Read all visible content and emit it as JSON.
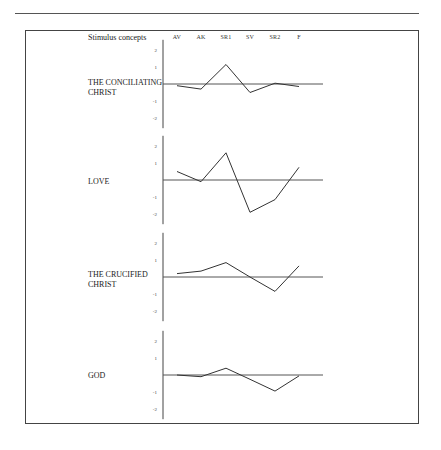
{
  "header": {
    "title": "Stimulus concepts",
    "columns": [
      "AV",
      "AK",
      "SR1",
      "SV",
      "SR2",
      "F"
    ]
  },
  "panels": [
    {
      "label_line1": "THE CONCILIATING",
      "label_line2": "CHRIST"
    },
    {
      "label_line1": "LOVE",
      "label_line2": ""
    },
    {
      "label_line1": "THE CRUCIFIED",
      "label_line2": "CHRIST"
    },
    {
      "label_line1": "GOD",
      "label_line2": ""
    }
  ],
  "y_ticks": [
    "2",
    "1",
    "-1",
    "-2"
  ],
  "chart_data": {
    "type": "line",
    "title": "Stimulus concepts",
    "xlabel": "",
    "ylabel": "",
    "categories": [
      "AV",
      "AK",
      "SR1",
      "SV",
      "SR2",
      "F"
    ],
    "ylim": [
      -2,
      2
    ],
    "yticks": [
      2,
      1,
      -1,
      -2
    ],
    "grid": false,
    "reference_line": 0,
    "layout": "four stacked panels sharing x categories",
    "series": [
      {
        "name": "THE CONCILIATING CHRIST",
        "values": [
          -0.1,
          -0.3,
          1.15,
          -0.5,
          0.05,
          -0.15
        ]
      },
      {
        "name": "LOVE",
        "values": [
          0.5,
          -0.1,
          1.6,
          -1.9,
          -1.15,
          0.75
        ]
      },
      {
        "name": "THE CRUCIFIED CHRIST",
        "values": [
          0.2,
          0.35,
          0.85,
          0.0,
          -0.85,
          0.65
        ]
      },
      {
        "name": "GOD",
        "values": [
          0.0,
          -0.1,
          0.4,
          -0.25,
          -0.95,
          -0.05
        ]
      }
    ]
  }
}
